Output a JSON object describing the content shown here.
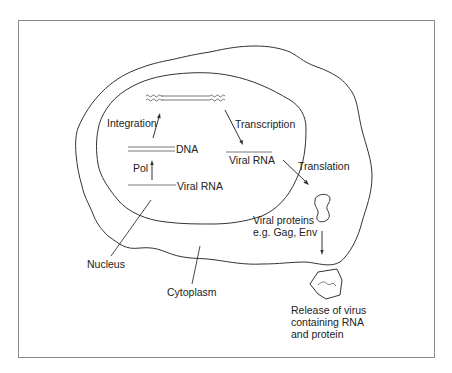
{
  "diagram": {
    "title": "",
    "labels": {
      "integration": "Integration",
      "transcription": "Transcription",
      "dna": "DNA",
      "pol": "Pol",
      "viral_rna_nucleus": "Viral RNA",
      "viral_rna_transcribed": "Viral RNA",
      "translation": "Translation",
      "viral_proteins_line1": "Viral proteins",
      "viral_proteins_line2": "e.g. Gag, Env",
      "nucleus": "Nucleus",
      "cytoplasm": "Cytoplasm",
      "release_line1": "Release of virus",
      "release_line2": "containing RNA",
      "release_line3": "and protein"
    },
    "nodes": [
      {
        "id": "integrated-provirus",
        "label": ""
      },
      {
        "id": "dna",
        "label": "DNA"
      },
      {
        "id": "viral-rna-genome",
        "label": "Viral RNA"
      },
      {
        "id": "viral-rna-transcript",
        "label": "Viral RNA"
      },
      {
        "id": "viral-proteins",
        "label": "Viral proteins e.g. Gag, Env"
      },
      {
        "id": "released-virus",
        "label": "Release of virus containing RNA and protein"
      }
    ],
    "edges": [
      {
        "from": "viral-rna-genome",
        "to": "dna",
        "label": "Pol"
      },
      {
        "from": "dna",
        "to": "integrated-provirus",
        "label": "Integration"
      },
      {
        "from": "integrated-provirus",
        "to": "viral-rna-transcript",
        "label": "Transcription"
      },
      {
        "from": "viral-rna-transcript",
        "to": "viral-proteins",
        "label": "Translation"
      },
      {
        "from": "viral-proteins",
        "to": "released-virus",
        "label": ""
      }
    ],
    "regions": [
      "Nucleus",
      "Cytoplasm"
    ],
    "colors": {
      "stroke": "#333333",
      "frame": "#8a8a8a",
      "text": "#222222",
      "background": "#ffffff"
    }
  }
}
